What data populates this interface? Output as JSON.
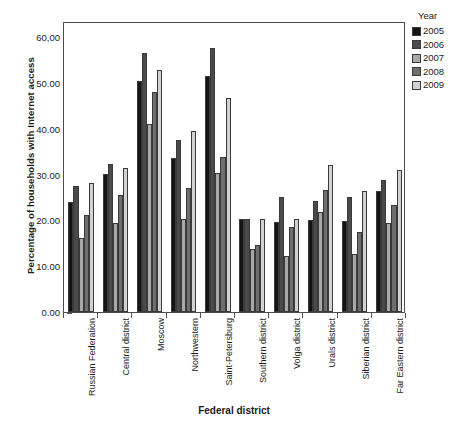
{
  "chart_data": {
    "type": "bar",
    "title": "",
    "xlabel": "Federal district",
    "ylabel": "Percentage of households with Internet access",
    "ylim": [
      0,
      63.5
    ],
    "grid": false,
    "legend_position": "right",
    "legend_title": "Year",
    "ytick_labels": [
      "60,00",
      "50.00",
      "40.00",
      "30.00",
      "20.00",
      "10.00",
      "0.00"
    ],
    "ytick_values": [
      60,
      50,
      40,
      30,
      20,
      10,
      0
    ],
    "categories": [
      "Russian Federation",
      "Central district",
      "Moscow",
      "Northwestern",
      "Saint-Petersburg",
      "Southern district",
      "Volga district",
      "Urals district",
      "Siberian district",
      "Far Eastern district"
    ],
    "series": [
      {
        "name": "2005",
        "color": "#141414",
        "values": [
          23.9,
          30.1,
          50.5,
          33.6,
          51.6,
          20.2,
          19.6,
          20.1,
          19.9,
          26.3
        ]
      },
      {
        "name": "2006",
        "color": "#4a4a4a",
        "values": [
          27.4,
          32.4,
          56.6,
          37.6,
          57.7,
          20.2,
          25.0,
          24.2,
          25.1,
          28.8
        ]
      },
      {
        "name": "2007",
        "color": "#a8a8a8",
        "values": [
          16.2,
          19.4,
          41.0,
          20.2,
          30.3,
          13.8,
          12.3,
          21.9,
          12.7,
          19.4
        ]
      },
      {
        "name": "2008",
        "color": "#6e6e6e",
        "values": [
          21.2,
          25.5,
          48.1,
          27.0,
          33.8,
          14.6,
          18.5,
          26.6,
          17.4,
          23.4
        ]
      },
      {
        "name": "2009",
        "color": "#d2d2d2",
        "values": [
          28.2,
          31.4,
          52.9,
          39.5,
          46.8,
          20.2,
          20.2,
          32.1,
          26.3,
          31.0
        ]
      }
    ]
  }
}
